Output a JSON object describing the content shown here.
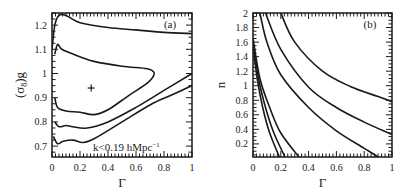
{
  "chart_data": [
    {
      "panel": "(a)",
      "type": "line",
      "subtype": "contour",
      "title": "",
      "xlabel": "Γ",
      "ylabel": "(σ8)g",
      "xlim": [
        0,
        1
      ],
      "ylim": [
        0.655,
        1.25
      ],
      "xticks": [
        "0",
        "0.2",
        "0.4",
        "0.6",
        "0.8",
        "1"
      ],
      "yticks": [
        "0.7",
        "0.8",
        "0.9",
        "1",
        "1.1",
        "1.2"
      ],
      "grid": false,
      "legend": null,
      "annotations": [
        "(a)",
        "k<0.19 hMpc⁻¹",
        "+ best fit at Γ≈0.28, (σ8)g≈0.94"
      ],
      "best_fit": {
        "x": 0.28,
        "y": 0.94
      },
      "series": [
        {
          "name": "contour-inner-1sigma",
          "points": [
            [
              0.02,
              1.08
            ],
            [
              0.04,
              1.12
            ],
            [
              0.07,
              1.1
            ],
            [
              0.15,
              1.08
            ],
            [
              0.3,
              1.05
            ],
            [
              0.5,
              1.03
            ],
            [
              0.68,
              1.02
            ],
            [
              0.73,
              1.0
            ],
            [
              0.68,
              0.96
            ],
            [
              0.55,
              0.91
            ],
            [
              0.4,
              0.85
            ],
            [
              0.3,
              0.83
            ],
            [
              0.2,
              0.84
            ],
            [
              0.1,
              0.845
            ],
            [
              0.04,
              0.86
            ],
            [
              0.02,
              0.9
            ]
          ]
        },
        {
          "name": "contour-middle-2sigma",
          "points": [
            [
              0.0,
              1.1
            ],
            [
              0.02,
              1.2
            ],
            [
              0.05,
              1.24
            ],
            [
              0.1,
              1.24
            ],
            [
              0.2,
              1.21
            ],
            [
              0.4,
              1.19
            ],
            [
              0.6,
              1.18
            ],
            [
              0.8,
              1.17
            ],
            [
              1.0,
              1.165
            ]
          ]
        },
        {
          "name": "contour-middle-2sigma-lower",
          "points": [
            [
              0.02,
              0.8
            ],
            [
              0.05,
              0.78
            ],
            [
              0.1,
              0.785
            ],
            [
              0.15,
              0.78
            ],
            [
              0.25,
              0.775
            ],
            [
              0.4,
              0.8
            ],
            [
              0.6,
              0.86
            ],
            [
              0.8,
              0.93
            ],
            [
              1.0,
              1.0
            ]
          ]
        },
        {
          "name": "contour-outer-3sigma-lower",
          "points": [
            [
              0.01,
              0.74
            ],
            [
              0.04,
              0.71
            ],
            [
              0.08,
              0.72
            ],
            [
              0.15,
              0.725
            ],
            [
              0.22,
              0.715
            ],
            [
              0.3,
              0.73
            ],
            [
              0.5,
              0.8
            ],
            [
              0.7,
              0.87
            ],
            [
              0.85,
              0.91
            ],
            [
              1.0,
              0.95
            ]
          ]
        }
      ]
    },
    {
      "panel": "(b)",
      "type": "line",
      "subtype": "contour",
      "title": "",
      "xlabel": "Γ",
      "ylabel": "n",
      "xlim": [
        0,
        1
      ],
      "ylim": [
        0.02,
        2
      ],
      "xticks": [
        "0",
        "0.2",
        "0.4",
        "0.6",
        "0.8",
        "1"
      ],
      "yticks": [
        "0.2",
        "0.4",
        "0.6",
        "0.8",
        "1",
        "1.2",
        "1.4",
        "1.6",
        "1.8",
        "2"
      ],
      "grid": false,
      "legend": null,
      "annotations": [
        "(b)"
      ],
      "series": [
        {
          "name": "contour-1",
          "points": [
            [
              0.0,
              1.55
            ],
            [
              0.03,
              1.1
            ],
            [
              0.07,
              0.7
            ],
            [
              0.12,
              0.35
            ],
            [
              0.19,
              0.02
            ]
          ]
        },
        {
          "name": "contour-2",
          "points": [
            [
              0.0,
              1.6
            ],
            [
              0.04,
              1.1
            ],
            [
              0.09,
              0.7
            ],
            [
              0.15,
              0.35
            ],
            [
              0.23,
              0.02
            ]
          ]
        },
        {
          "name": "contour-3",
          "points": [
            [
              0.0,
              1.65
            ],
            [
              0.05,
              1.1
            ],
            [
              0.12,
              0.7
            ],
            [
              0.2,
              0.35
            ],
            [
              0.33,
              0.02
            ]
          ]
        },
        {
          "name": "contour-4",
          "points": [
            [
              0.05,
              2.0
            ],
            [
              0.1,
              1.6
            ],
            [
              0.2,
              1.15
            ],
            [
              0.4,
              0.7
            ],
            [
              0.6,
              0.38
            ],
            [
              0.8,
              0.14
            ],
            [
              0.9,
              0.02
            ]
          ]
        },
        {
          "name": "contour-5",
          "points": [
            [
              0.09,
              2.0
            ],
            [
              0.2,
              1.5
            ],
            [
              0.4,
              0.98
            ],
            [
              0.6,
              0.7
            ],
            [
              0.8,
              0.5
            ],
            [
              1.0,
              0.33
            ]
          ]
        },
        {
          "name": "contour-6",
          "points": [
            [
              0.2,
              2.0
            ],
            [
              0.3,
              1.6
            ],
            [
              0.5,
              1.2
            ],
            [
              0.7,
              0.99
            ],
            [
              0.9,
              0.85
            ],
            [
              1.0,
              0.78
            ]
          ]
        }
      ]
    }
  ],
  "panels": {
    "a": {
      "label": "(a)",
      "annotation": "k<0.19 hMpc",
      "annotation_sup": "−1",
      "xlabel": "Γ",
      "ylabel_main": "(σ",
      "ylabel_sub": "8",
      "ylabel_end": ")g",
      "marker": "+"
    },
    "b": {
      "label": "(b)",
      "xlabel": "Γ",
      "ylabel": "n"
    }
  }
}
